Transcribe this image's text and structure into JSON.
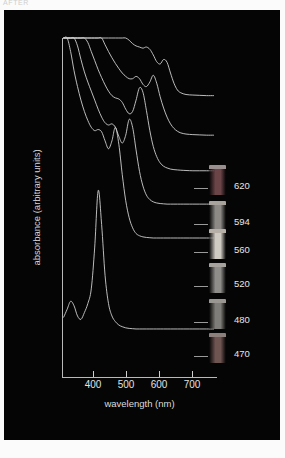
{
  "header": {
    "caption": "AFTER"
  },
  "figure": {
    "background_color": "#050505",
    "axis_color": "#b9b9b9",
    "text_color": "#e2e2e2",
    "curve_color": "#cfcfcf"
  },
  "chart_data": {
    "type": "line",
    "title": "",
    "subtitle": "",
    "xlabel": "wavelength (nm)",
    "ylabel": "absorbance (arbitrary units)",
    "xlim": [
      330,
      780
    ],
    "ylim": [
      0,
      6
    ],
    "xticks": [
      400,
      500,
      600,
      700
    ],
    "xticklabels": [
      "400",
      "500",
      "600",
      "700"
    ],
    "yticks": [],
    "yticklabels": [],
    "grid": false,
    "legend_position": "right",
    "note": "Six vertically offset UV-Vis absorbance spectra of dye solutions; each trace is annotated at right by a photographed vial and its characteristic absorption wavelength in nm.",
    "series": [
      {
        "name": "620",
        "label": "620",
        "swatch_color": "#6b4448",
        "swatch_cap_color": "#9a8e8e",
        "offset_index": 5,
        "peaks_nm": [
          620,
          575,
          430
        ],
        "x": [
          335,
          345,
          355,
          365,
          375,
          385,
          395,
          405,
          415,
          425,
          435,
          445,
          455,
          465,
          475,
          485,
          495,
          505,
          515,
          525,
          535,
          545,
          555,
          565,
          575,
          585,
          595,
          605,
          615,
          625,
          635,
          645,
          655,
          665,
          675,
          690,
          710,
          730,
          750,
          770
        ],
        "y": [
          6.0,
          5.72,
          5.45,
          5.2,
          4.96,
          4.74,
          4.52,
          4.32,
          4.14,
          3.97,
          3.82,
          3.68,
          3.55,
          3.43,
          3.31,
          3.2,
          3.09,
          3.0,
          2.93,
          2.86,
          2.8,
          2.76,
          2.74,
          2.72,
          2.74,
          2.7,
          2.6,
          2.48,
          2.44,
          2.52,
          2.47,
          2.28,
          2.1,
          1.98,
          1.93,
          1.9,
          1.89,
          1.885,
          1.88,
          1.88
        ]
      },
      {
        "name": "594",
        "label": "594",
        "swatch_color": "#8d8a86",
        "swatch_cap_color": "#a9a39d",
        "offset_index": 4,
        "peaks_nm": [
          594,
          548,
          420
        ],
        "x": [
          335,
          345,
          355,
          365,
          375,
          385,
          395,
          405,
          415,
          425,
          435,
          445,
          455,
          465,
          475,
          485,
          495,
          505,
          515,
          525,
          535,
          545,
          555,
          565,
          575,
          585,
          595,
          605,
          615,
          625,
          635,
          645,
          655,
          665,
          675,
          690,
          710,
          730,
          750,
          770
        ],
        "y": [
          6.0,
          5.68,
          5.38,
          5.1,
          4.84,
          4.6,
          4.38,
          4.18,
          4.0,
          3.83,
          3.67,
          3.53,
          3.4,
          3.28,
          3.17,
          3.07,
          2.98,
          2.9,
          2.84,
          2.8,
          2.8,
          2.84,
          2.8,
          2.7,
          2.66,
          2.74,
          2.86,
          2.72,
          2.48,
          2.28,
          2.12,
          2.0,
          1.92,
          1.87,
          1.84,
          1.82,
          1.81,
          1.805,
          1.8,
          1.8
        ]
      },
      {
        "name": "560",
        "label": "560",
        "swatch_color": "#cfcac2",
        "swatch_cap_color": "#b6b0a8",
        "offset_index": 3,
        "peaks_nm": [
          560,
          520,
          415
        ],
        "x": [
          335,
          345,
          355,
          365,
          375,
          385,
          395,
          405,
          415,
          425,
          435,
          445,
          455,
          465,
          475,
          485,
          495,
          505,
          515,
          525,
          535,
          545,
          555,
          565,
          575,
          585,
          595,
          605,
          615,
          625,
          635,
          645,
          655,
          665,
          675,
          690,
          710,
          730,
          750,
          770
        ],
        "y": [
          6.0,
          5.62,
          5.28,
          4.98,
          4.7,
          4.46,
          4.24,
          4.06,
          3.9,
          3.74,
          3.58,
          3.44,
          3.31,
          3.2,
          3.12,
          3.08,
          3.06,
          3.0,
          2.88,
          2.8,
          2.84,
          3.04,
          3.26,
          3.18,
          2.86,
          2.5,
          2.22,
          2.04,
          1.93,
          1.87,
          1.84,
          1.82,
          1.81,
          1.805,
          1.8,
          1.795,
          1.79,
          1.79,
          1.79,
          1.79
        ]
      },
      {
        "name": "520",
        "label": "520",
        "swatch_color": "#8e8d8a",
        "swatch_cap_color": "#a6a29d",
        "offset_index": 2,
        "peaks_nm": [
          520,
          480,
          410
        ],
        "x": [
          335,
          345,
          355,
          365,
          375,
          385,
          395,
          405,
          415,
          425,
          435,
          445,
          455,
          465,
          475,
          485,
          495,
          505,
          515,
          525,
          535,
          545,
          555,
          565,
          575,
          585,
          595,
          605,
          615,
          625,
          635,
          645,
          655,
          665,
          675,
          690,
          710,
          730,
          750,
          770
        ],
        "y": [
          6.0,
          5.58,
          5.22,
          4.9,
          4.62,
          4.38,
          4.16,
          3.98,
          3.82,
          3.66,
          3.5,
          3.36,
          3.26,
          3.22,
          3.24,
          3.18,
          3.02,
          2.9,
          3.04,
          3.32,
          3.18,
          2.78,
          2.4,
          2.14,
          1.98,
          1.9,
          1.86,
          1.84,
          1.83,
          1.825,
          1.82,
          1.82,
          1.82,
          1.82,
          1.82,
          1.82,
          1.82,
          1.82,
          1.82,
          1.82
        ]
      },
      {
        "name": "480",
        "label": "480",
        "swatch_color": "#7f7d79",
        "swatch_cap_color": "#9a9691",
        "offset_index": 1,
        "peaks_nm": [
          480,
          445,
          405
        ],
        "x": [
          335,
          345,
          355,
          365,
          375,
          385,
          395,
          405,
          415,
          425,
          435,
          445,
          455,
          465,
          475,
          485,
          495,
          505,
          515,
          525,
          535,
          545,
          555,
          565,
          575,
          585,
          595,
          605,
          615,
          625,
          635,
          645,
          655,
          665,
          675,
          690,
          710,
          730,
          750,
          770
        ],
        "y": [
          6.0,
          5.54,
          5.14,
          4.8,
          4.52,
          4.28,
          4.08,
          3.92,
          3.8,
          3.74,
          3.76,
          3.72,
          3.56,
          3.42,
          3.56,
          3.8,
          3.5,
          2.96,
          2.5,
          2.2,
          2.02,
          1.92,
          1.88,
          1.86,
          1.85,
          1.845,
          1.84,
          1.84,
          1.84,
          1.84,
          1.84,
          1.84,
          1.84,
          1.84,
          1.84,
          1.84,
          1.84,
          1.84,
          1.84,
          1.84
        ]
      },
      {
        "name": "470",
        "label": "470",
        "swatch_color": "#6f5552",
        "swatch_cap_color": "#8d807c",
        "offset_index": 0,
        "peaks_nm": [
          470,
          420,
          380
        ],
        "x": [
          335,
          345,
          355,
          365,
          375,
          385,
          395,
          405,
          415,
          425,
          435,
          445,
          455,
          465,
          475,
          485,
          495,
          505,
          515,
          525,
          535,
          545,
          555,
          565,
          575,
          585,
          595,
          605,
          615,
          625,
          635,
          645,
          655,
          665,
          675,
          690,
          710,
          730,
          750,
          770
        ],
        "y": [
          1.06,
          1.2,
          1.34,
          1.26,
          1.08,
          1.02,
          1.14,
          1.3,
          1.56,
          2.3,
          3.3,
          2.7,
          1.8,
          1.3,
          1.08,
          0.98,
          0.92,
          0.89,
          0.87,
          0.86,
          0.855,
          0.85,
          0.85,
          0.85,
          0.85,
          0.85,
          0.85,
          0.85,
          0.85,
          0.85,
          0.85,
          0.85,
          0.85,
          0.85,
          0.85,
          0.85,
          0.85,
          0.85,
          0.85,
          0.85
        ]
      }
    ]
  }
}
